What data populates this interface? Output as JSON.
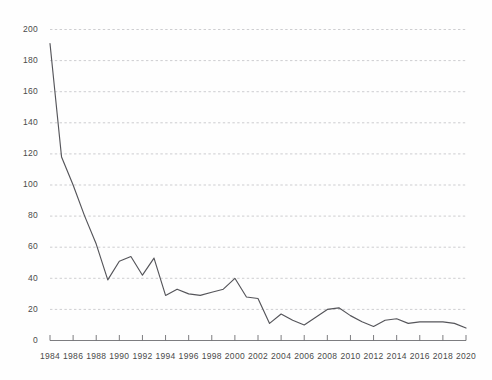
{
  "chart_data": {
    "type": "line",
    "title": "",
    "subtitle": "",
    "xlabel": "",
    "ylabel": "",
    "xlim": [
      1984,
      2020
    ],
    "ylim": [
      0,
      200
    ],
    "grid": true,
    "grid_axis": "y",
    "legend": false,
    "legend_position": "none",
    "line_color": "#55555a",
    "grid_color": "#b9b9bd",
    "axis_color": "#6e6e72",
    "background_color": "#fefefe",
    "y_ticks": [
      0,
      20,
      40,
      60,
      80,
      100,
      120,
      140,
      160,
      180,
      200
    ],
    "y_tick_labels": [
      "0",
      "20",
      "40",
      "60",
      "80",
      "100",
      "120",
      "140",
      "160",
      "180",
      "200"
    ],
    "x_ticks": [
      1984,
      1986,
      1988,
      1990,
      1992,
      1994,
      1996,
      1998,
      2000,
      2002,
      2004,
      2006,
      2008,
      2010,
      2012,
      2014,
      2016,
      2018,
      2020
    ],
    "x_tick_labels": [
      "1984",
      "1986",
      "1988",
      "1990",
      "1992",
      "1994",
      "1996",
      "1998",
      "2000",
      "2002",
      "2004",
      "2006",
      "2008",
      "2010",
      "2012",
      "2014",
      "2016",
      "2018",
      "2020"
    ],
    "x": [
      1984,
      1985,
      1986,
      1987,
      1988,
      1989,
      1990,
      1991,
      1992,
      1993,
      1994,
      1995,
      1996,
      1997,
      1998,
      1999,
      2000,
      2001,
      2002,
      2003,
      2004,
      2005,
      2006,
      2007,
      2008,
      2009,
      2010,
      2011,
      2012,
      2013,
      2014,
      2015,
      2016,
      2017,
      2018,
      2019,
      2020
    ],
    "values": [
      191,
      118,
      100,
      80,
      62,
      39,
      51,
      54,
      42,
      53,
      29,
      33,
      30,
      29,
      31,
      33,
      40,
      28,
      27,
      11,
      17,
      13,
      10,
      15,
      20,
      21,
      16,
      12,
      9,
      13,
      14,
      11,
      12,
      12,
      12,
      11,
      8
    ],
    "series": [
      {
        "name": "series-1",
        "values": [
          191,
          118,
          100,
          80,
          62,
          39,
          51,
          54,
          42,
          53,
          29,
          33,
          30,
          29,
          31,
          33,
          40,
          28,
          27,
          11,
          17,
          13,
          10,
          15,
          20,
          21,
          16,
          12,
          9,
          13,
          14,
          11,
          12,
          12,
          12,
          11,
          8
        ]
      }
    ]
  }
}
